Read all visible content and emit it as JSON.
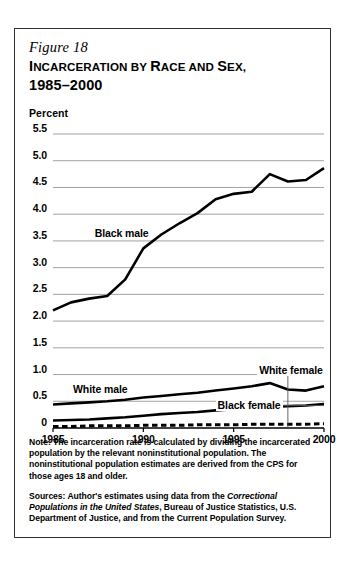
{
  "figure": {
    "number_label": "Figure 18",
    "title_line1": "INCARCERATION BY RACE AND SEX,",
    "title_line2": "1985–2000",
    "title_smallcaps_segments": [
      "I",
      "NCARCERATION",
      " BY ",
      "R",
      "ACE AND ",
      "S",
      "EX,"
    ]
  },
  "notes": {
    "note_label": "Note:",
    "note_text": " The incarceration rate is calculated by dividing the incarcerated population by the relevant noninstitutional population. The noninstitutional population estimates are derived from the CPS for those ages 18 and older.",
    "sources_label": "Sources:",
    "sources_text_part1": " Author's estimates using data from the ",
    "sources_italic": "Correctional Populations in the United States",
    "sources_text_part2": ", Bureau of Justice Statistics, U.S. Department of Justice, and from the Current Population Survey."
  },
  "chart_data": {
    "type": "line",
    "title": "Incarceration by Race and Sex, 1985–2000",
    "xlabel": "",
    "ylabel": "Percent",
    "ylim": [
      0,
      5.5
    ],
    "xlim": [
      1985,
      2000
    ],
    "yticks": [
      "0",
      "0.5",
      "1.0",
      "1.5",
      "2.0",
      "2.5",
      "3.0",
      "3.5",
      "4.0",
      "4.5",
      "5.0",
      "5.5"
    ],
    "ytick_values": [
      0,
      0.5,
      1.0,
      1.5,
      2.0,
      2.5,
      3.0,
      3.5,
      4.0,
      4.5,
      5.0,
      5.5
    ],
    "xticks": [
      "1985",
      "1990",
      "1995",
      "2000"
    ],
    "xtick_values": [
      1985,
      1990,
      1995,
      2000
    ],
    "grid": "horizontal",
    "legend_position": "inline-annotations",
    "x": [
      1985,
      1986,
      1987,
      1988,
      1989,
      1990,
      1991,
      1992,
      1993,
      1994,
      1995,
      1996,
      1997,
      1998,
      1999,
      2000
    ],
    "series": [
      {
        "name": "Black male",
        "style": "solid",
        "label_x": 1987.2,
        "label_y": 3.62,
        "values": [
          2.2,
          2.35,
          2.42,
          2.47,
          2.78,
          3.36,
          3.62,
          3.83,
          4.02,
          4.28,
          4.38,
          4.42,
          4.75,
          4.61,
          4.64,
          4.86
        ]
      },
      {
        "name": "White male",
        "style": "solid",
        "label_x": 1986.0,
        "label_y": 0.72,
        "values": [
          0.44,
          0.46,
          0.48,
          0.5,
          0.53,
          0.57,
          0.6,
          0.63,
          0.66,
          0.7,
          0.74,
          0.78,
          0.84,
          0.72,
          0.7,
          0.78
        ]
      },
      {
        "name": "Black female",
        "style": "solid",
        "label_x": 1994.0,
        "label_y": 0.42,
        "values": [
          0.14,
          0.15,
          0.16,
          0.18,
          0.2,
          0.23,
          0.26,
          0.28,
          0.3,
          0.33,
          0.35,
          0.37,
          0.4,
          0.41,
          0.42,
          0.45
        ]
      },
      {
        "name": "White female",
        "style": "dashed",
        "label_x": 1996.3,
        "label_y": 1.06,
        "leader_x": 1998.0,
        "values": [
          0.03,
          0.03,
          0.04,
          0.04,
          0.04,
          0.05,
          0.05,
          0.05,
          0.06,
          0.06,
          0.06,
          0.07,
          0.07,
          0.07,
          0.07,
          0.08
        ]
      }
    ]
  },
  "colors": {
    "line": "#000000",
    "grid": "#7a7a7a",
    "axis": "#000000",
    "border": "#333333",
    "background": "#ffffff"
  }
}
